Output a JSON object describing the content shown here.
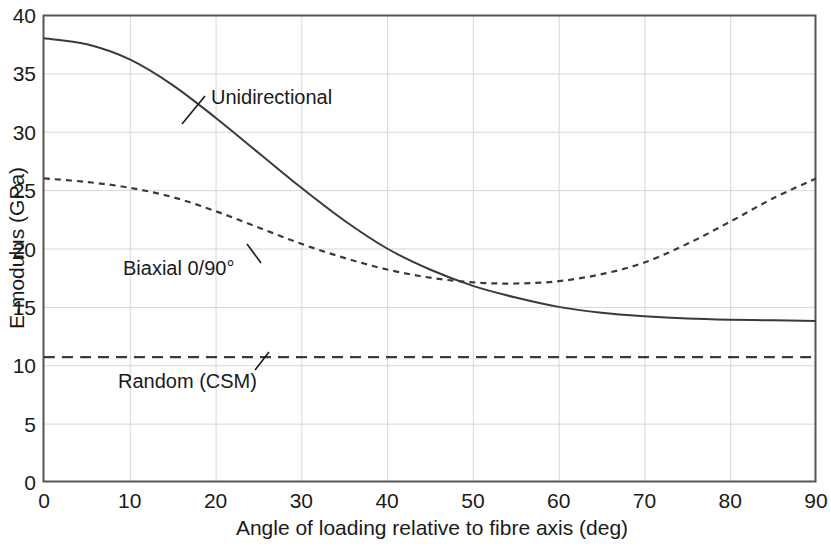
{
  "chart_data": {
    "type": "line",
    "title": "",
    "xlabel": "Angle of loading relative to fibre axis (deg)",
    "ylabel": "E-modulus (GPa)",
    "xlim": [
      0,
      90
    ],
    "ylim": [
      0,
      40
    ],
    "xticks": [
      "0",
      "10",
      "20",
      "30",
      "40",
      "50",
      "60",
      "70",
      "80",
      "90"
    ],
    "yticks": [
      "0",
      "5",
      "10",
      "15",
      "20",
      "25",
      "30",
      "35",
      "40"
    ],
    "grid": true,
    "legend_position": "inline-annotations",
    "x": [
      0,
      5,
      10,
      15,
      20,
      25,
      30,
      35,
      40,
      45,
      50,
      55,
      60,
      65,
      70,
      75,
      80,
      85,
      90
    ],
    "series": [
      {
        "name": "Unidirectional",
        "style": "solid",
        "color": "#3a3a3a",
        "values": [
          38.0,
          37.5,
          36.2,
          34.0,
          31.2,
          28.2,
          25.2,
          22.4,
          20.0,
          18.2,
          16.8,
          15.8,
          15.0,
          14.5,
          14.2,
          14.0,
          13.9,
          13.85,
          13.8
        ]
      },
      {
        "name": "Biaxial 0/90°",
        "style": "dotted",
        "color": "#3a3a3a",
        "values": [
          26.0,
          25.7,
          25.2,
          24.4,
          23.2,
          21.8,
          20.4,
          19.2,
          18.2,
          17.5,
          17.1,
          17.0,
          17.2,
          17.8,
          18.8,
          20.4,
          22.3,
          24.3,
          26.0
        ]
      },
      {
        "name": "Random (CSM)",
        "style": "dashed",
        "color": "#3a3a3a",
        "values": [
          10.7,
          10.7,
          10.7,
          10.7,
          10.7,
          10.7,
          10.7,
          10.7,
          10.7,
          10.7,
          10.7,
          10.7,
          10.7,
          10.7,
          10.7,
          10.7,
          10.7,
          10.7,
          10.7
        ]
      }
    ],
    "annotations": [
      {
        "text": "Unidirectional",
        "x": 22.5,
        "y": 31.6
      },
      {
        "text": "Biaxial 0/90°",
        "x": 8.5,
        "y": 18.2
      },
      {
        "text": "Random (CSM)",
        "x": 9.0,
        "y": 8.8
      }
    ]
  }
}
